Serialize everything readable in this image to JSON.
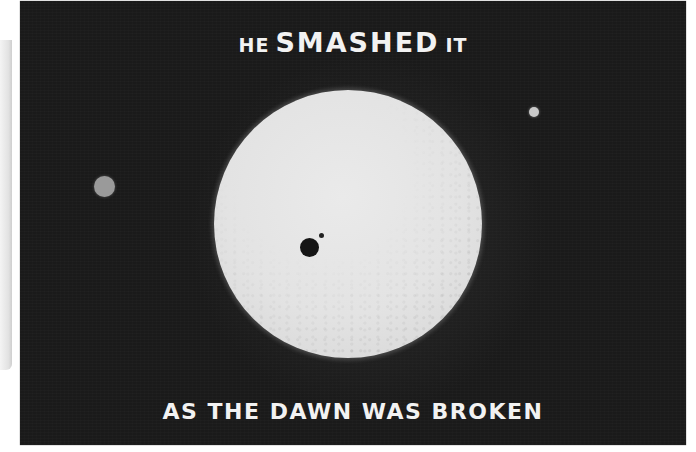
{
  "poster": {
    "headline": {
      "prefix": "HE",
      "emphasis": "SMASHED",
      "suffix": "IT"
    },
    "caption": "AS THE DAWN WAS BROKEN"
  },
  "illustration": {
    "sun": "sun-disc",
    "spots": [
      "large-sunspot",
      "small-sunspot"
    ],
    "planets": [
      "left-planet",
      "right-planet"
    ]
  },
  "colors": {
    "background": "#1a1a1a",
    "sun": "#e3e3e3",
    "text": "#f2f2f2",
    "spot": "#151515"
  }
}
